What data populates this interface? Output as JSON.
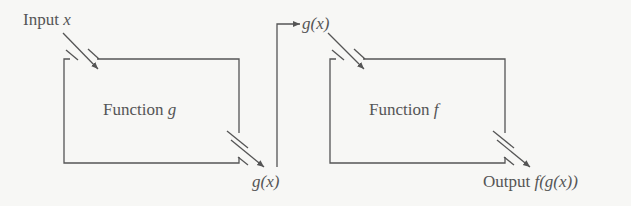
{
  "diagram": {
    "input_label": "Input",
    "input_var": "x",
    "box_g": {
      "label": "Function",
      "var": "g"
    },
    "box_f": {
      "label": "Function",
      "var": "f"
    },
    "g_out_label": "g(x)",
    "f_in_label": "g(x)",
    "output_label": "Output",
    "output_expr": "f(g(x))",
    "stroke_color": "#555555"
  }
}
